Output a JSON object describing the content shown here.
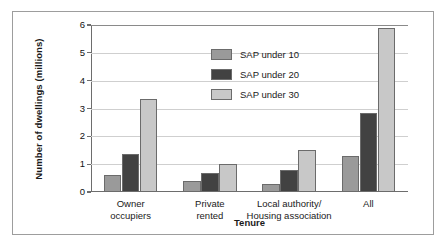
{
  "chart_data": {
    "type": "bar",
    "title": "",
    "subtitle": "",
    "xlabel": "Tenure",
    "ylabel": "Number of dwellings (millions)",
    "categories": [
      "Owner occupiers",
      "Private rented",
      "Local authority/Housing association",
      "All"
    ],
    "category_lines": [
      [
        "Owner",
        "occupiers"
      ],
      [
        "Private",
        "rented"
      ],
      [
        "Local authority/",
        "Housing association"
      ],
      [
        "All"
      ]
    ],
    "series": [
      {
        "name": "SAP under 10",
        "color": "#9a9a9a",
        "values": [
          0.6,
          0.4,
          0.3,
          1.3
        ]
      },
      {
        "name": "SAP under 20",
        "color": "#424242",
        "values": [
          1.35,
          0.68,
          0.78,
          2.85
        ]
      },
      {
        "name": "SAP under 30",
        "color": "#c8c8c8",
        "values": [
          3.35,
          1.0,
          1.5,
          5.9
        ]
      }
    ],
    "ylim": [
      0,
      6
    ],
    "yticks": [
      0,
      1,
      2,
      3,
      4,
      5,
      6
    ],
    "ytick_labels": [
      "0",
      "1",
      "2",
      "3",
      "4",
      "5",
      "6"
    ],
    "grid": true,
    "grid_axis": "y",
    "legend_position": "upper-left-inside",
    "frame_color": "#9d9d9d",
    "axis_color": "#6d6d6d",
    "gridline_color": "#cfcfcf",
    "background": "#ffffff"
  }
}
